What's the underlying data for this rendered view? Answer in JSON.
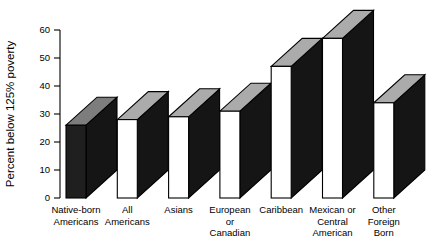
{
  "figure": {
    "background": "#ffffff"
  },
  "chart_data": {
    "type": "bar",
    "variant": "3d-slab-bars",
    "title": "",
    "xlabel": "",
    "ylabel": "Percent below 125% poverty",
    "ylim": [
      0,
      60
    ],
    "yticks": [
      0,
      10,
      20,
      30,
      40,
      50,
      60
    ],
    "grid": false,
    "legend": null,
    "categories": [
      "Native-born Americans",
      "All Americans",
      "Asians",
      "European or Canadian",
      "Caribbean",
      "Mexican or Central American",
      "Other Foreign Born"
    ],
    "category_lines": [
      [
        "Native-born",
        "Americans"
      ],
      [
        "All",
        "Americans"
      ],
      [
        "Asians"
      ],
      [
        "European",
        "or",
        "Canadian"
      ],
      [
        "Caribbean"
      ],
      [
        "Mexican or",
        "Central",
        "American"
      ],
      [
        "Other",
        "Foreign",
        "Born"
      ]
    ],
    "values": [
      26,
      28,
      29,
      31,
      47,
      57,
      34
    ],
    "colors": {
      "background": "#ffffff",
      "front_default": "#ffffff",
      "front_first": "#1f1f1f",
      "top_default": "#ababab",
      "top_first": "#7d7d7d",
      "side": "#151515",
      "outline": "#000000",
      "text": "#000000"
    }
  }
}
